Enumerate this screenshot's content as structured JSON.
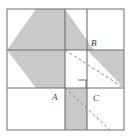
{
  "figure": {
    "canvas": {
      "width": 132,
      "height": 138,
      "background": "#ffffff"
    },
    "colors": {
      "shaded_fill": "#c9c9c9",
      "unshaded_fill": "#ffffff",
      "grid_stroke": "#6e6e6e",
      "outer_stroke": "#7a7a7a",
      "dashed_stroke": "#8a8a8a",
      "label_color": "#3b3b3b"
    },
    "outer_square": {
      "x": 7,
      "y": 9,
      "width": 117,
      "height": 121
    },
    "grid_lines": [
      {
        "name": "vertical-midline",
        "x1": 65,
        "y1": 9,
        "x2": 65,
        "y2": 130
      },
      {
        "name": "horizontal-midline",
        "x1": 7,
        "y1": 50,
        "x2": 124,
        "y2": 50
      },
      {
        "name": "vertical-right",
        "x1": 87,
        "y1": 9,
        "x2": 87,
        "y2": 130
      },
      {
        "name": "horizontal-lower",
        "x1": 7,
        "y1": 88,
        "x2": 124,
        "y2": 88
      }
    ],
    "shaded_regions": [
      {
        "name": "diamond-upper",
        "points": "7,50 36,9 65,9 65,50"
      },
      {
        "name": "diamond-upper-right",
        "points": "65,9 94,50 65,50"
      },
      {
        "name": "diamond-lower-left",
        "points": "7,50 36,88 65,88 65,50"
      },
      {
        "name": "triangle-mid-right",
        "points": "87,50 124,50 124,88"
      },
      {
        "name": "triangle-bottom-mid",
        "points": "65,88 87,88 87,130 65,130"
      }
    ],
    "dashed_diagonals": [
      {
        "name": "diagonal-B-to-corner",
        "x1": 65,
        "y1": 50,
        "x2": 124,
        "y2": 88
      },
      {
        "name": "diagonal-A-to-corner",
        "x1": 65,
        "y1": 88,
        "x2": 110,
        "y2": 130
      }
    ],
    "right_angle_mark": {
      "x": 78,
      "y": 80,
      "size": 8
    },
    "labels": [
      {
        "name": "vertex-label-A",
        "text": "A",
        "x": 52,
        "y": 100
      },
      {
        "name": "vertex-label-B",
        "text": "B",
        "x": 91,
        "y": 46
      },
      {
        "name": "vertex-label-C",
        "text": "C",
        "x": 93,
        "y": 101
      }
    ]
  }
}
